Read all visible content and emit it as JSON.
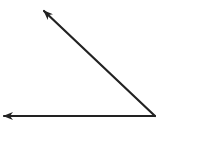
{
  "diagram": {
    "type": "angle",
    "background": "#ffffff",
    "stroke_color": "#222222",
    "stroke_width": 2.2,
    "vertex": {
      "x": 155,
      "y": 116
    },
    "rays": [
      {
        "name": "upper-ray",
        "from": {
          "x": 155,
          "y": 116
        },
        "to": {
          "x": 44,
          "y": 11
        },
        "arrowhead": true
      },
      {
        "name": "horizontal-ray",
        "from": {
          "x": 155,
          "y": 116
        },
        "to": {
          "x": 4,
          "y": 116
        },
        "arrowhead": true
      }
    ],
    "labels": []
  }
}
